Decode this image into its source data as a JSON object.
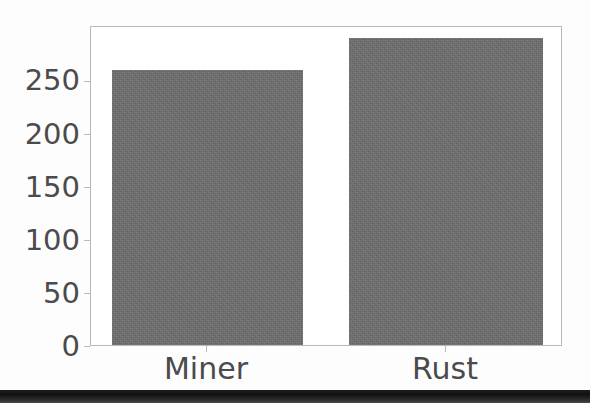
{
  "chart_data": {
    "type": "bar",
    "title": "",
    "subtitle": "",
    "xlabel": "",
    "ylabel": "",
    "categories": [
      "Miner",
      "Rust"
    ],
    "values": [
      257,
      287
    ],
    "series": [
      {
        "name": "count",
        "values": [
          257,
          287
        ]
      }
    ],
    "ylim": [
      0,
      297
    ],
    "yticks": [
      0,
      50,
      100,
      150,
      200,
      250
    ],
    "ytick_labels": [
      "0",
      "50",
      "100",
      "150",
      "200",
      "250"
    ],
    "xtick_labels": [
      "Miner",
      "Rust"
    ],
    "grid": false,
    "legend": null,
    "legend_position": "none",
    "annotations": [],
    "bar_color": "#6e6e6e",
    "axis_color": "#b9b9b9",
    "text_color": "#4b4b4b",
    "background_color": "#ffffff"
  },
  "figure": {
    "bottom_band_color": "#1d1d1d"
  }
}
